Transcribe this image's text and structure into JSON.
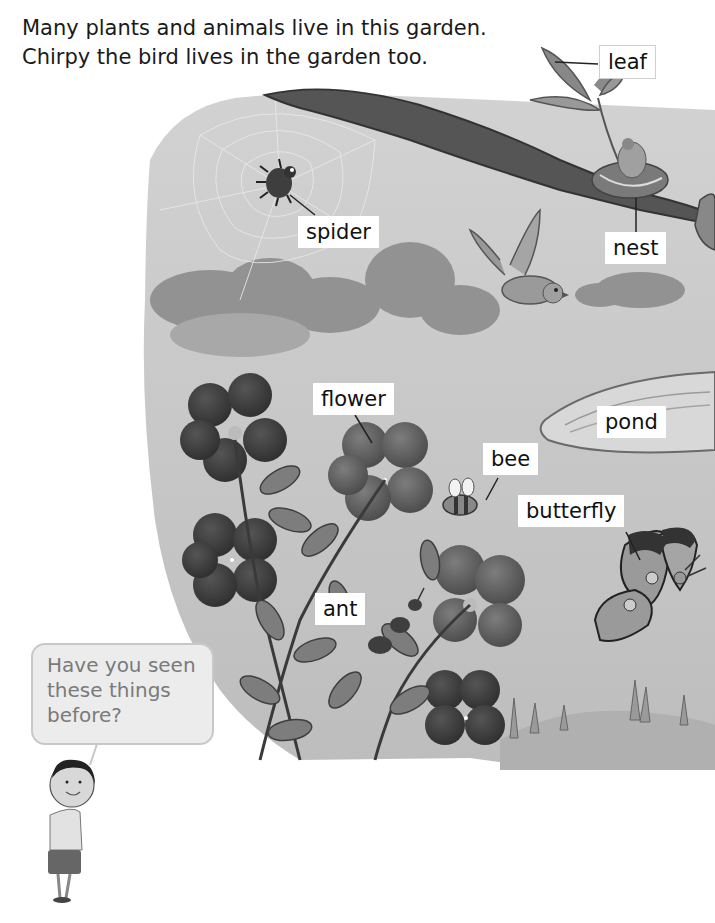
{
  "intro": {
    "line1": "Many plants and animals live in this garden.",
    "line2": "Chirpy the bird lives in the garden too."
  },
  "illustration": {
    "description": "Watercolor garden scene with branch, nest, spider web, bird, clouds, pond, flowers, bee, butterfly and ant",
    "labels": [
      {
        "id": "leaf",
        "text": "leaf"
      },
      {
        "id": "spider",
        "text": "spider"
      },
      {
        "id": "nest",
        "text": "nest"
      },
      {
        "id": "flower",
        "text": "flower"
      },
      {
        "id": "pond",
        "text": "pond"
      },
      {
        "id": "bee",
        "text": "bee"
      },
      {
        "id": "butterfly",
        "text": "butterfly"
      },
      {
        "id": "ant",
        "text": "ant"
      }
    ]
  },
  "speech_bubble": {
    "line1": "Have you seen",
    "line2": "these things",
    "line3": "before?"
  },
  "colors": {
    "background": "#ffffff",
    "scene_sky": "#c9c9c9",
    "text": "#1a1a1a",
    "bubble_text": "#7a7a7a"
  }
}
